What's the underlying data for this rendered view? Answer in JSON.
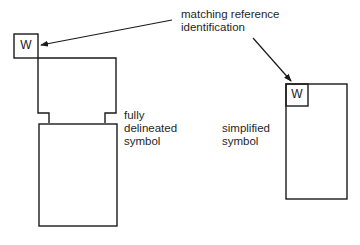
{
  "annotation": {
    "text": "matching reference\nidentification"
  },
  "full_symbol": {
    "label": "fully\ndelineated\nsymbol",
    "reference_letter": "W"
  },
  "simplified_symbol": {
    "label": "simplified\nsymbol",
    "reference_letter": "W"
  },
  "colors": {
    "line": "#1a1a1a",
    "background": "#ffffff"
  }
}
